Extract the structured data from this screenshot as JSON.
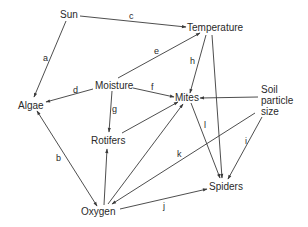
{
  "diagram": {
    "type": "food-web / ecological influence diagram",
    "nodes": [
      {
        "id": "sun",
        "label": "Sun"
      },
      {
        "id": "temperature",
        "label": "Temperature"
      },
      {
        "id": "moisture",
        "label": "Moisture"
      },
      {
        "id": "algae",
        "label": "Algae"
      },
      {
        "id": "mites",
        "label": "Mites"
      },
      {
        "id": "soil",
        "label_lines": [
          "Soil",
          "particle",
          "size"
        ]
      },
      {
        "id": "rotifers",
        "label": "Rotifers"
      },
      {
        "id": "oxygen",
        "label": "Oxygen"
      },
      {
        "id": "spiders",
        "label": "Spiders"
      }
    ],
    "edges": [
      {
        "label": "a",
        "from": "Sun",
        "to": "Algae"
      },
      {
        "label": "c",
        "from": "Sun",
        "to": "Temperature"
      },
      {
        "label": "e",
        "from": "Moisture",
        "to": "Temperature"
      },
      {
        "label": "d",
        "from": "Moisture",
        "to": "Algae"
      },
      {
        "label": "f",
        "from": "Moisture",
        "to": "Mites"
      },
      {
        "label": "g",
        "from": "Moisture",
        "to": "Rotifers"
      },
      {
        "label": "h",
        "from": "Temperature",
        "to": "Mites"
      },
      {
        "label": "",
        "from": "Temperature",
        "to": "Spiders"
      },
      {
        "label": "",
        "from": "Soil particle size",
        "to": "Mites"
      },
      {
        "label": "i",
        "from": "Soil particle size",
        "to": "Spiders"
      },
      {
        "label": "k",
        "from": "Soil particle size",
        "to": "Oxygen"
      },
      {
        "label": "l",
        "from": "Mites",
        "to": "Spiders"
      },
      {
        "label": "",
        "from": "Rotifers",
        "to": "Mites"
      },
      {
        "label": "",
        "from": "Oxygen",
        "to": "Mites"
      },
      {
        "label": "",
        "from": "Oxygen",
        "to": "Rotifers"
      },
      {
        "label": "j",
        "from": "Oxygen",
        "to": "Spiders"
      },
      {
        "label": "b",
        "from": "Algae",
        "to": "Oxygen",
        "bidirectional": true
      }
    ]
  },
  "labels": {
    "sun": "Sun",
    "temperature": "Temperature",
    "moisture": "Moisture",
    "algae": "Algae",
    "mites": "Mites",
    "soil_1": "Soil",
    "soil_2": "particle",
    "soil_3": "size",
    "rotifers": "Rotifers",
    "oxygen": "Oxygen",
    "spiders": "Spiders"
  },
  "edge_labels": {
    "a": "a",
    "b": "b",
    "c": "c",
    "d": "d",
    "e": "e",
    "f": "f",
    "g": "g",
    "h": "h",
    "i": "i",
    "j": "j",
    "k": "k",
    "l": "l"
  },
  "colors": {
    "line": "#3a3a3a",
    "text": "#2a2a2a",
    "background": "#ffffff"
  }
}
